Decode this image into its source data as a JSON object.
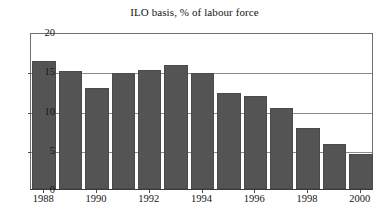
{
  "chart_data": {
    "type": "bar",
    "title": "ILO basis, % of labour force",
    "xlabel": "",
    "ylabel": "",
    "categories": [
      "1988",
      "1989",
      "1990",
      "1991",
      "1992",
      "1993",
      "1994",
      "1995",
      "1996",
      "1997",
      "1998",
      "1999",
      "2000"
    ],
    "values": [
      16.3,
      15.0,
      12.9,
      14.8,
      15.1,
      15.8,
      14.8,
      12.2,
      11.9,
      10.3,
      7.8,
      5.7,
      4.5
    ],
    "ylim": [
      0,
      20
    ],
    "yticks": [
      0,
      5,
      10,
      15,
      20
    ],
    "ytick_labels": [
      "0",
      "5",
      "10",
      "15",
      "20"
    ],
    "xtick_labels": [
      "1988",
      "1990",
      "1992",
      "1994",
      "1996",
      "1998",
      "2000"
    ],
    "xtick_categories": [
      "1988",
      "1990",
      "1992",
      "1994",
      "1996",
      "1998",
      "2000"
    ],
    "grid": true,
    "grid_axis": "y",
    "legend": false,
    "legend_position": "none",
    "bar_color": "#545454",
    "grid_color": "#8a8a8a",
    "frame_color": "#6f6f6f",
    "text_color": "#141414",
    "background": "#ffffff"
  }
}
